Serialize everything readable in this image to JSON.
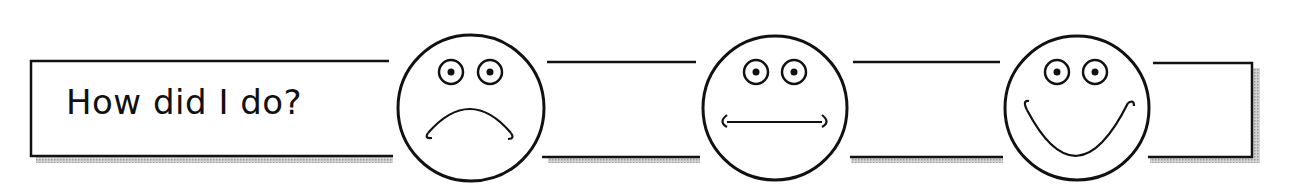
{
  "header": {
    "prompt": "How did I do?"
  },
  "rating_scale": {
    "options": [
      {
        "name": "sad",
        "label": "Sad face",
        "mouth": "frown"
      },
      {
        "name": "neutral",
        "label": "Neutral face",
        "mouth": "straight"
      },
      {
        "name": "happy",
        "label": "Happy face",
        "mouth": "smile"
      }
    ]
  },
  "colors": {
    "stroke": "#111111",
    "shadow": "#b8b8b8",
    "background": "#ffffff"
  }
}
